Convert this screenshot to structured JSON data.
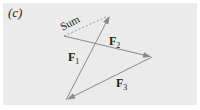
{
  "figure": {
    "panel_label": "(c)",
    "vectors": [
      {
        "name": "F",
        "sub": "1",
        "from": [
          66,
          100
        ],
        "to": [
          110,
          15
        ],
        "style": "solid"
      },
      {
        "name": "F",
        "sub": "2",
        "from": [
          64,
          36
        ],
        "to": [
          152,
          57
        ],
        "style": "solid"
      },
      {
        "name": "F",
        "sub": "3",
        "from": [
          152,
          57
        ],
        "to": [
          66,
          100
        ],
        "style": "solid"
      },
      {
        "name": "Sum",
        "from": [
          64,
          36
        ],
        "to": [
          110,
          15
        ],
        "style": "dashed"
      }
    ],
    "labels": {
      "sum": "Sum",
      "f1": {
        "main": "F",
        "sub": "1"
      },
      "f2": {
        "main": "F",
        "sub": "2"
      },
      "f3": {
        "main": "F",
        "sub": "3"
      }
    },
    "colors": {
      "background": "#ebebeb",
      "vector": "#8a8a8a",
      "text": "#222222"
    }
  }
}
